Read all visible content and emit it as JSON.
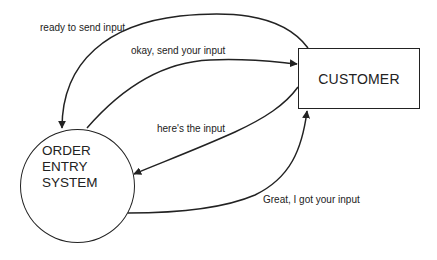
{
  "diagram": {
    "type": "data-flow",
    "nodes": {
      "customer": {
        "label": "CUSTOMER",
        "shape": "rectangle"
      },
      "order_entry_system": {
        "shape": "circle",
        "lines": [
          "ORDER",
          "ENTRY",
          "SYSTEM"
        ]
      }
    },
    "edges": [
      {
        "label": "ready to send input",
        "from": "CUSTOMER",
        "to": "ORDER ENTRY SYSTEM"
      },
      {
        "label": "okay, send your input",
        "from": "ORDER ENTRY SYSTEM",
        "to": "CUSTOMER"
      },
      {
        "label": "here's the input",
        "from": "CUSTOMER",
        "to": "ORDER ENTRY SYSTEM"
      },
      {
        "label": "Great, I got your input",
        "from": "ORDER ENTRY SYSTEM",
        "to": "CUSTOMER"
      }
    ],
    "colors": {
      "stroke": "#222222",
      "background": "#ffffff",
      "text": "#222222"
    }
  }
}
